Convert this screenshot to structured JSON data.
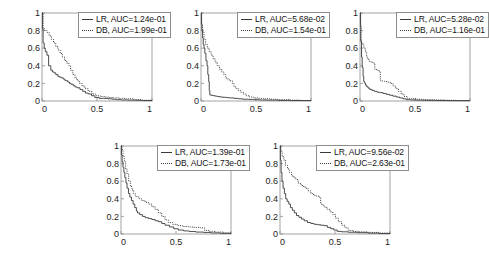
{
  "figure": {
    "kind": "multi-panel-step-curve-figure",
    "panel_count": 5,
    "rows": [
      3,
      2
    ]
  },
  "axis": {
    "xticks": [
      "0",
      "0.5",
      "1"
    ],
    "xtick_values": [
      0,
      0.5,
      1
    ],
    "yticks": [
      "0",
      "0.2",
      "0.4",
      "0.6",
      "0.8",
      "1"
    ],
    "ytick_values": [
      0,
      0.2,
      0.4,
      0.6,
      0.8,
      1
    ],
    "xlim": [
      0,
      1
    ],
    "ylim": [
      0,
      1
    ],
    "xlabel": "",
    "ylabel": "",
    "grid": false
  },
  "series_style": {
    "lr_color": "#3a3a3a",
    "db_color": "#3a3a3a",
    "lr_line": "solid",
    "db_line": "dotted",
    "axis_color": "#8d8d8d"
  },
  "panels": [
    {
      "id": "panel-1",
      "legend": {
        "lr_label": "LR, AUC=1.24e-01",
        "db_label": "DB, AUC=1.99e-01"
      }
    },
    {
      "id": "panel-2",
      "legend": {
        "lr_label": "LR, AUC=5.68e-02",
        "db_label": "DB, AUC=1.54e-01"
      }
    },
    {
      "id": "panel-3",
      "legend": {
        "lr_label": "LR, AUC=5.28e-02",
        "db_label": "DB, AUC=1.16e-01"
      }
    },
    {
      "id": "panel-4",
      "legend": {
        "lr_label": "LR, AUC=1.39e-01",
        "db_label": "DB, AUC=1.73e-01"
      }
    },
    {
      "id": "panel-5",
      "legend": {
        "lr_label": "LR, AUC=9.56e-02",
        "db_label": "DB, AUC=2.63e-01"
      }
    }
  ],
  "chart_data": [
    {
      "type": "line",
      "title": "",
      "xlabel": "",
      "ylabel": "",
      "xlim": [
        0,
        1
      ],
      "ylim": [
        0,
        1
      ],
      "grid": false,
      "legend_position": "top-right",
      "xticks": [
        0,
        0.5,
        1
      ],
      "yticks": [
        0,
        0.2,
        0.4,
        0.6,
        0.8,
        1
      ],
      "series": [
        {
          "name": "LR, AUC=1.24e-01",
          "auc": 0.124,
          "style": "solid",
          "x": [
            0.0,
            0.005,
            0.01,
            0.02,
            0.03,
            0.045,
            0.06,
            0.08,
            0.095,
            0.11,
            0.125,
            0.145,
            0.16,
            0.18,
            0.2,
            0.215,
            0.235,
            0.25,
            0.265,
            0.285,
            0.3,
            0.32,
            0.345,
            0.37,
            0.395,
            0.42,
            0.45,
            0.48,
            0.52,
            0.56,
            0.6,
            0.64,
            0.68,
            0.72,
            0.78,
            0.85,
            0.92,
            1.0
          ],
          "y": [
            1.0,
            0.82,
            0.66,
            0.6,
            0.56,
            0.52,
            0.4,
            0.35,
            0.33,
            0.32,
            0.3,
            0.28,
            0.27,
            0.26,
            0.24,
            0.23,
            0.215,
            0.2,
            0.19,
            0.175,
            0.16,
            0.15,
            0.13,
            0.11,
            0.09,
            0.08,
            0.06,
            0.04,
            0.03,
            0.03,
            0.025,
            0.02,
            0.015,
            0.012,
            0.01,
            0.008,
            0.005,
            0.003
          ]
        },
        {
          "name": "DB, AUC=1.99e-01",
          "auc": 0.199,
          "style": "dotted",
          "x": [
            0.0,
            0.01,
            0.025,
            0.045,
            0.065,
            0.085,
            0.105,
            0.125,
            0.145,
            0.165,
            0.185,
            0.205,
            0.225,
            0.245,
            0.26,
            0.28,
            0.3,
            0.32,
            0.34,
            0.365,
            0.39,
            0.42,
            0.455,
            0.49,
            0.53,
            0.57,
            0.61,
            0.65,
            0.7,
            0.76,
            0.83,
            0.9,
            1.0
          ],
          "y": [
            1.0,
            0.82,
            0.8,
            0.78,
            0.74,
            0.7,
            0.66,
            0.62,
            0.58,
            0.54,
            0.5,
            0.46,
            0.43,
            0.4,
            0.35,
            0.3,
            0.26,
            0.23,
            0.2,
            0.17,
            0.14,
            0.11,
            0.08,
            0.06,
            0.05,
            0.045,
            0.04,
            0.035,
            0.03,
            0.025,
            0.015,
            0.008,
            0.003
          ]
        }
      ]
    },
    {
      "type": "line",
      "title": "",
      "xlabel": "",
      "ylabel": "",
      "xlim": [
        0,
        1
      ],
      "ylim": [
        0,
        1
      ],
      "grid": false,
      "legend_position": "top-right",
      "xticks": [
        0,
        0.5,
        1
      ],
      "yticks": [
        0,
        0.2,
        0.4,
        0.6,
        0.8,
        1
      ],
      "series": [
        {
          "name": "LR, AUC=5.68e-02",
          "auc": 0.0568,
          "style": "solid",
          "x": [
            0.0,
            0.004,
            0.008,
            0.014,
            0.02,
            0.028,
            0.035,
            0.045,
            0.055,
            0.062,
            0.07,
            0.075,
            0.08,
            0.09,
            0.11,
            0.13,
            0.15,
            0.175,
            0.2,
            0.23,
            0.26,
            0.3,
            0.34,
            0.38,
            0.43,
            0.48,
            0.53,
            0.6,
            0.7,
            0.82,
            1.0
          ],
          "y": [
            1.0,
            0.88,
            0.8,
            0.72,
            0.64,
            0.6,
            0.54,
            0.46,
            0.4,
            0.3,
            0.22,
            0.12,
            0.07,
            0.065,
            0.06,
            0.055,
            0.05,
            0.045,
            0.042,
            0.038,
            0.035,
            0.03,
            0.025,
            0.02,
            0.018,
            0.015,
            0.012,
            0.01,
            0.007,
            0.005,
            0.003
          ]
        },
        {
          "name": "DB, AUC=1.54e-01",
          "auc": 0.154,
          "style": "dotted",
          "x": [
            0.0,
            0.006,
            0.015,
            0.028,
            0.042,
            0.058,
            0.075,
            0.092,
            0.11,
            0.128,
            0.148,
            0.168,
            0.188,
            0.208,
            0.225,
            0.245,
            0.265,
            0.285,
            0.3,
            0.32,
            0.34,
            0.36,
            0.385,
            0.41,
            0.44,
            0.48,
            0.52,
            0.57,
            0.63,
            0.7,
            0.8,
            0.9,
            1.0
          ],
          "y": [
            1.0,
            0.86,
            0.78,
            0.7,
            0.64,
            0.6,
            0.56,
            0.52,
            0.48,
            0.44,
            0.4,
            0.36,
            0.33,
            0.3,
            0.26,
            0.24,
            0.23,
            0.2,
            0.16,
            0.14,
            0.12,
            0.1,
            0.08,
            0.06,
            0.045,
            0.035,
            0.03,
            0.025,
            0.02,
            0.015,
            0.01,
            0.006,
            0.003
          ]
        }
      ]
    },
    {
      "type": "line",
      "title": "",
      "xlabel": "",
      "ylabel": "",
      "xlim": [
        0,
        1
      ],
      "ylim": [
        0,
        1
      ],
      "grid": false,
      "legend_position": "top-right",
      "xticks": [
        0,
        0.5,
        1
      ],
      "yticks": [
        0,
        0.2,
        0.4,
        0.6,
        0.8,
        1
      ],
      "series": [
        {
          "name": "LR, AUC=5.28e-02",
          "auc": 0.0528,
          "style": "solid",
          "x": [
            0.0,
            0.004,
            0.008,
            0.014,
            0.02,
            0.028,
            0.034,
            0.04,
            0.05,
            0.062,
            0.075,
            0.09,
            0.11,
            0.13,
            0.155,
            0.18,
            0.21,
            0.24,
            0.27,
            0.3,
            0.33,
            0.36,
            0.39,
            0.42,
            0.46,
            0.51,
            0.56,
            0.62,
            0.7,
            0.8,
            1.0
          ],
          "y": [
            1.0,
            0.86,
            0.68,
            0.5,
            0.38,
            0.28,
            0.22,
            0.205,
            0.18,
            0.16,
            0.145,
            0.13,
            0.12,
            0.11,
            0.1,
            0.095,
            0.085,
            0.075,
            0.065,
            0.055,
            0.045,
            0.035,
            0.025,
            0.015,
            0.012,
            0.01,
            0.008,
            0.007,
            0.005,
            0.004,
            0.003
          ]
        },
        {
          "name": "DB, AUC=1.16e-01",
          "auc": 0.116,
          "style": "dotted",
          "x": [
            0.0,
            0.006,
            0.014,
            0.025,
            0.035,
            0.048,
            0.06,
            0.072,
            0.085,
            0.1,
            0.118,
            0.135,
            0.15,
            0.165,
            0.185,
            0.205,
            0.225,
            0.25,
            0.275,
            0.3,
            0.325,
            0.35,
            0.375,
            0.4,
            0.43,
            0.47,
            0.52,
            0.58,
            0.66,
            0.76,
            0.87,
            1.0
          ],
          "y": [
            1.0,
            0.68,
            0.66,
            0.64,
            0.6,
            0.56,
            0.5,
            0.47,
            0.45,
            0.44,
            0.43,
            0.36,
            0.35,
            0.34,
            0.23,
            0.225,
            0.22,
            0.215,
            0.2,
            0.17,
            0.14,
            0.11,
            0.08,
            0.05,
            0.03,
            0.025,
            0.02,
            0.015,
            0.012,
            0.008,
            0.005,
            0.003
          ]
        }
      ]
    },
    {
      "type": "line",
      "title": "",
      "xlabel": "",
      "ylabel": "",
      "xlim": [
        0,
        1
      ],
      "ylim": [
        0,
        1
      ],
      "grid": false,
      "legend_position": "top-right",
      "xticks": [
        0,
        0.5,
        1
      ],
      "yticks": [
        0,
        0.2,
        0.4,
        0.6,
        0.8,
        1
      ],
      "series": [
        {
          "name": "LR, AUC=1.39e-01",
          "auc": 0.139,
          "style": "solid",
          "x": [
            0.0,
            0.004,
            0.01,
            0.018,
            0.026,
            0.035,
            0.045,
            0.055,
            0.068,
            0.08,
            0.095,
            0.11,
            0.125,
            0.14,
            0.15,
            0.17,
            0.195,
            0.22,
            0.25,
            0.28,
            0.31,
            0.34,
            0.37,
            0.4,
            0.44,
            0.48,
            0.52,
            0.57,
            0.62,
            0.68,
            0.75,
            0.82,
            0.9,
            1.0
          ],
          "y": [
            1.0,
            0.9,
            0.82,
            0.76,
            0.7,
            0.64,
            0.58,
            0.52,
            0.46,
            0.42,
            0.38,
            0.34,
            0.3,
            0.26,
            0.24,
            0.22,
            0.2,
            0.185,
            0.175,
            0.165,
            0.15,
            0.14,
            0.12,
            0.1,
            0.08,
            0.06,
            0.045,
            0.035,
            0.028,
            0.022,
            0.018,
            0.012,
            0.008,
            0.003
          ]
        },
        {
          "name": "DB, AUC=1.73e-01",
          "auc": 0.173,
          "style": "dotted",
          "x": [
            0.0,
            0.008,
            0.018,
            0.03,
            0.042,
            0.055,
            0.07,
            0.085,
            0.1,
            0.115,
            0.13,
            0.145,
            0.165,
            0.19,
            0.22,
            0.25,
            0.28,
            0.31,
            0.34,
            0.37,
            0.4,
            0.43,
            0.47,
            0.51,
            0.56,
            0.61,
            0.66,
            0.72,
            0.76,
            0.8,
            0.86,
            0.93,
            1.0
          ],
          "y": [
            1.0,
            0.96,
            0.88,
            0.82,
            0.74,
            0.68,
            0.6,
            0.54,
            0.5,
            0.46,
            0.43,
            0.42,
            0.4,
            0.38,
            0.36,
            0.34,
            0.31,
            0.28,
            0.24,
            0.2,
            0.16,
            0.13,
            0.11,
            0.095,
            0.085,
            0.08,
            0.075,
            0.07,
            0.04,
            0.03,
            0.022,
            0.012,
            0.003
          ]
        }
      ]
    },
    {
      "type": "line",
      "title": "",
      "xlabel": "",
      "ylabel": "",
      "xlim": [
        0,
        1
      ],
      "ylim": [
        0,
        1
      ],
      "grid": false,
      "legend_position": "top-right",
      "xticks": [
        0,
        0.5,
        1
      ],
      "yticks": [
        0,
        0.2,
        0.4,
        0.6,
        0.8,
        1
      ],
      "series": [
        {
          "name": "LR, AUC=9.56e-02",
          "auc": 0.0956,
          "style": "solid",
          "x": [
            0.0,
            0.004,
            0.01,
            0.018,
            0.028,
            0.04,
            0.052,
            0.065,
            0.08,
            0.095,
            0.112,
            0.13,
            0.15,
            0.172,
            0.195,
            0.22,
            0.25,
            0.28,
            0.31,
            0.34,
            0.37,
            0.4,
            0.43,
            0.46,
            0.49,
            0.52,
            0.56,
            0.62,
            0.7,
            0.8,
            0.9,
            1.0
          ],
          "y": [
            1.0,
            0.84,
            0.7,
            0.6,
            0.52,
            0.46,
            0.4,
            0.37,
            0.34,
            0.3,
            0.27,
            0.24,
            0.21,
            0.19,
            0.17,
            0.15,
            0.13,
            0.12,
            0.11,
            0.105,
            0.1,
            0.095,
            0.075,
            0.06,
            0.045,
            0.03,
            0.025,
            0.02,
            0.015,
            0.01,
            0.006,
            0.003
          ]
        },
        {
          "name": "DB, AUC=2.63e-01",
          "auc": 0.263,
          "style": "dotted",
          "x": [
            0.0,
            0.008,
            0.02,
            0.035,
            0.05,
            0.068,
            0.085,
            0.105,
            0.125,
            0.145,
            0.165,
            0.185,
            0.205,
            0.23,
            0.255,
            0.28,
            0.305,
            0.33,
            0.355,
            0.37,
            0.39,
            0.41,
            0.43,
            0.455,
            0.48,
            0.505,
            0.53,
            0.56,
            0.59,
            0.62,
            0.66,
            0.72,
            0.8,
            0.9,
            1.0
          ],
          "y": [
            1.0,
            0.94,
            0.88,
            0.84,
            0.78,
            0.74,
            0.7,
            0.66,
            0.64,
            0.62,
            0.58,
            0.56,
            0.54,
            0.52,
            0.49,
            0.46,
            0.44,
            0.43,
            0.42,
            0.34,
            0.32,
            0.3,
            0.28,
            0.25,
            0.22,
            0.18,
            0.14,
            0.1,
            0.07,
            0.04,
            0.03,
            0.025,
            0.018,
            0.01,
            0.003
          ]
        }
      ]
    }
  ]
}
